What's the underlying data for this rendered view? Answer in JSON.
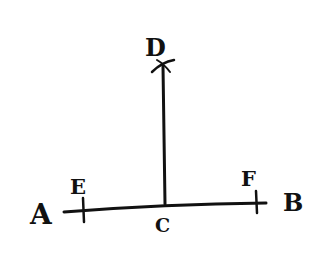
{
  "diagram": {
    "type": "geometric-construction",
    "points": {
      "A": {
        "label": "A"
      },
      "B": {
        "label": "B"
      },
      "C": {
        "label": "C"
      },
      "D": {
        "label": "D"
      },
      "E": {
        "label": "E"
      },
      "F": {
        "label": "F"
      }
    },
    "segments": [
      {
        "from": "A",
        "to": "B",
        "name": "line-ab"
      },
      {
        "from": "C",
        "to": "D",
        "name": "line-cd"
      }
    ],
    "tick_marks": [
      "E",
      "F"
    ],
    "arc_mark": "D",
    "ink_color": "#111111",
    "background": "#ffffff"
  }
}
